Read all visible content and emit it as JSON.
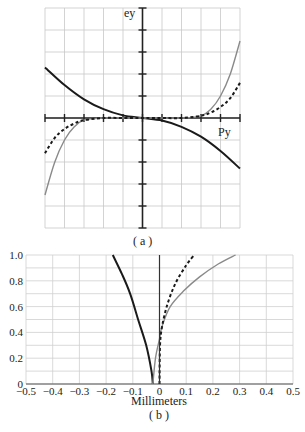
{
  "chart_data": [
    {
      "id": "a",
      "type": "line",
      "caption": "( a )",
      "xlabel": "Py",
      "ylabel": "ey",
      "grid": true,
      "xlim": [
        -5,
        5
      ],
      "ylim": [
        -5,
        5
      ],
      "series": [
        {
          "name": "dark-solid",
          "style": "solid",
          "color": "#1a1a1a",
          "x": [
            -5,
            -4,
            -3,
            -2,
            -1,
            0,
            1,
            2,
            3,
            4,
            5
          ],
          "y": [
            2.3,
            1.5,
            0.85,
            0.4,
            0.12,
            0,
            -0.12,
            -0.4,
            -0.85,
            -1.5,
            -2.3
          ]
        },
        {
          "name": "gray-solid",
          "style": "solid",
          "color": "#8a8a8a",
          "x": [
            -5,
            -4.5,
            -4,
            -3.5,
            -3,
            -2,
            -1,
            0,
            1,
            2,
            3,
            3.5,
            4,
            4.5,
            5
          ],
          "y": [
            -3.5,
            -2.0,
            -1.0,
            -0.4,
            -0.1,
            0,
            0,
            0,
            0,
            0,
            0.1,
            0.4,
            1.0,
            2.0,
            3.5
          ]
        },
        {
          "name": "dashed",
          "style": "dashed",
          "color": "#1a1a1a",
          "x": [
            -5,
            -4.5,
            -4,
            -3.5,
            -3,
            -2,
            -1,
            0,
            1,
            2,
            3,
            3.5,
            4,
            4.5,
            5
          ],
          "y": [
            -1.6,
            -0.9,
            -0.5,
            -0.25,
            -0.1,
            0,
            0,
            0,
            0,
            0,
            0.1,
            0.25,
            0.5,
            0.9,
            1.6
          ]
        }
      ]
    },
    {
      "id": "b",
      "type": "line",
      "caption": "( b )",
      "xlabel": "Millimeters",
      "ylabel": "",
      "grid": true,
      "xlim": [
        -0.5,
        0.5
      ],
      "ylim": [
        0,
        1.0
      ],
      "xticks": [
        "-0.5",
        "-0.4",
        "-0.3",
        "-0.2",
        "-0.1",
        "0",
        "0.1",
        "0.2",
        "0.3",
        "0.4",
        "0.5"
      ],
      "yticks": [
        "0",
        "0.2",
        "0.4",
        "0.6",
        "0.8",
        "1.0"
      ],
      "series": [
        {
          "name": "dark-solid",
          "style": "solid",
          "color": "#1a1a1a",
          "x": [
            -0.025,
            -0.03,
            -0.05,
            -0.08,
            -0.11,
            -0.14,
            -0.175
          ],
          "y": [
            0,
            0.1,
            0.3,
            0.5,
            0.7,
            0.85,
            1.0
          ]
        },
        {
          "name": "gray-solid",
          "style": "solid",
          "color": "#8a8a8a",
          "x": [
            -0.025,
            -0.015,
            0,
            0.01,
            0.04,
            0.09,
            0.15,
            0.22,
            0.285
          ],
          "y": [
            0,
            0.2,
            0.35,
            0.45,
            0.6,
            0.72,
            0.83,
            0.93,
            1.0
          ]
        },
        {
          "name": "dashed",
          "style": "dashed",
          "color": "#1a1a1a",
          "x": [
            0,
            0.002,
            0.01,
            0.03,
            0.06,
            0.1,
            0.13
          ],
          "y": [
            0,
            0.3,
            0.45,
            0.62,
            0.78,
            0.92,
            1.0
          ]
        },
        {
          "name": "zero-line",
          "style": "solid",
          "color": "#333333",
          "x": [
            0,
            0
          ],
          "y": [
            0,
            1.0
          ]
        }
      ]
    }
  ]
}
